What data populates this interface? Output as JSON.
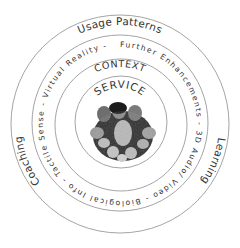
{
  "diagram": {
    "type": "concentric-circles",
    "center": {
      "x": 120,
      "y": 124
    },
    "rings": [
      {
        "name": "outer",
        "radius": 109
      },
      {
        "name": "enhancements",
        "radius": 88
      },
      {
        "name": "context",
        "radius": 66
      },
      {
        "name": "service",
        "radius": 46
      }
    ],
    "labels": {
      "usage_patterns": "Usage Patterns",
      "learning": "Learning",
      "coaching": "Coaching",
      "enhancements_ring": "Further Enhancements  -  3D Audio/ Video  -  Biological Info  -  Tactile Sense  -  Virtual Reality  -",
      "context": "CONTEXT",
      "service": "SERVICE"
    },
    "center_image": "group-photo-of-people",
    "colors": {
      "ring_stroke": "#9a9a9a",
      "text": "#333333",
      "background": "#ffffff"
    }
  }
}
